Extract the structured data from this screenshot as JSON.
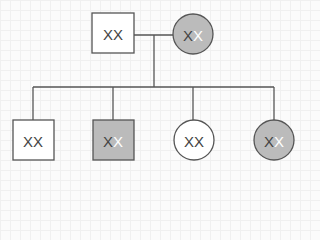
{
  "diagram": {
    "type": "pedigree",
    "colors": {
      "line": "#555555",
      "unaffected_fill": "#ffffff",
      "carrier_fill": "#bbbbbb",
      "dark_allele": "#444444",
      "light_allele": "#ffffff"
    },
    "parents": {
      "father": {
        "sex": "male",
        "shape": "square",
        "status": "unaffected",
        "allele1": "X",
        "allele2": "X"
      },
      "mother": {
        "sex": "female",
        "shape": "circle",
        "status": "carrier",
        "allele1": "X",
        "allele2": "X"
      }
    },
    "children": [
      {
        "sex": "male",
        "shape": "square",
        "status": "unaffected",
        "allele1": "X",
        "allele2": "X"
      },
      {
        "sex": "male",
        "shape": "square",
        "status": "affected",
        "allele1": "X",
        "allele2": "X"
      },
      {
        "sex": "female",
        "shape": "circle",
        "status": "unaffected",
        "allele1": "X",
        "allele2": "X"
      },
      {
        "sex": "female",
        "shape": "circle",
        "status": "carrier",
        "allele1": "X",
        "allele2": "X"
      }
    ]
  }
}
